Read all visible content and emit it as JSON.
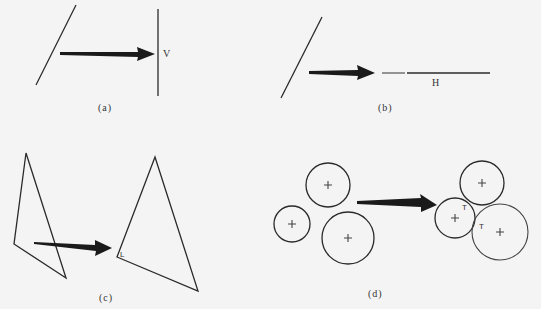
{
  "panels": {
    "a": {
      "caption": "(a)",
      "line_label": "V",
      "description": "oblique line projected onto a vertical reference line V"
    },
    "b": {
      "caption": "(b)",
      "line_label": "H",
      "description": "oblique line projected onto a horizontal reference line H"
    },
    "c": {
      "caption": "(c)",
      "corner_mark": "L",
      "description": "irregular triangle adjusted to have a right-angle corner"
    },
    "d": {
      "caption": "(d)",
      "tangent_marks": [
        "T",
        "T"
      ],
      "description": "separate circles moved to be mutually tangent"
    }
  },
  "colors": {
    "stroke": "#2a2a2a",
    "arrow": "#1a1a1a",
    "background": "#f4f4f4"
  }
}
